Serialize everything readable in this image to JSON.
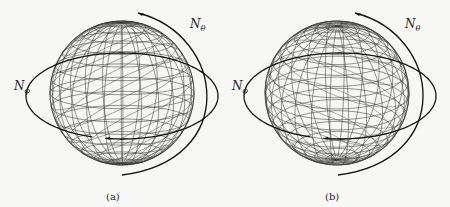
{
  "figure": {
    "background": "#f7f7f5",
    "wire_color": "#3a3a3a",
    "arc_color": "#111111",
    "panels": [
      {
        "id": "a",
        "caption": "(a)",
        "caption_pos": [
          106,
          191
        ],
        "sphere": {
          "cx": 122,
          "cy": 93,
          "r": 72,
          "tilt_deg": 0,
          "lat_lines": 16,
          "lon_lines": 12,
          "pole_visible_top": false,
          "variant": "tilted-grid"
        },
        "labels": [
          {
            "base": "N",
            "sub": "ϕ",
            "x": 14,
            "y": 80
          },
          {
            "base": "N",
            "sub": "θ",
            "x": 190,
            "y": 18
          }
        ],
        "n_phi_ellipse": {
          "cx": 122,
          "cy": 96,
          "rx": 96,
          "ry": 43,
          "gap_start_deg": 100,
          "gap_end_deg": 108
        },
        "n_theta_arc": {
          "start": [
            138,
            13
          ],
          "ctrl1": [
            225,
            35
          ],
          "ctrl2": [
            240,
            160
          ],
          "end": [
            122,
            175
          ]
        }
      },
      {
        "id": "b",
        "caption": "(b)",
        "caption_pos": [
          324,
          191
        ],
        "sphere": {
          "cx": 337,
          "cy": 93,
          "r": 72,
          "tilt_deg": 0,
          "lat_lines": 20,
          "lon_lines": 12,
          "pole_visible_top": true,
          "variant": "upright-grid"
        },
        "labels": [
          {
            "base": "N",
            "sub": "ϕ",
            "x": 232,
            "y": 80
          },
          {
            "base": "N",
            "sub": "θ",
            "x": 405,
            "y": 18
          }
        ],
        "n_phi_ellipse": {
          "cx": 340,
          "cy": 96,
          "rx": 96,
          "ry": 43,
          "gap_start_deg": 100,
          "gap_end_deg": 108
        },
        "n_theta_arc": {
          "start": [
            355,
            13
          ],
          "ctrl1": [
            442,
            35
          ],
          "ctrl2": [
            455,
            160
          ],
          "end": [
            338,
            175
          ]
        }
      }
    ]
  }
}
